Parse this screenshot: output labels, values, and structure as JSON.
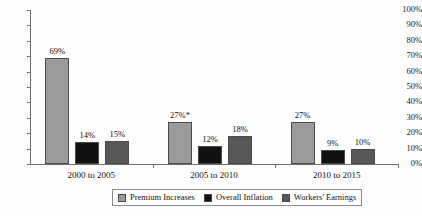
{
  "chart_data": {
    "type": "bar",
    "title": "",
    "subtitle": "",
    "xlabel": "",
    "ylabel": "",
    "ylim": [
      0,
      100
    ],
    "grid": false,
    "legend_position": "bottom",
    "categories": [
      "2000 to 2005",
      "2005 to 2010",
      "2010 to 2015"
    ],
    "y_ticks": [
      "0%",
      "10%",
      "20%",
      "30%",
      "40%",
      "50%",
      "60%",
      "70%",
      "80%",
      "90%",
      "100%"
    ],
    "y_tick_values": [
      0,
      10,
      20,
      30,
      40,
      50,
      60,
      70,
      80,
      90,
      100
    ],
    "series": [
      {
        "name": "Premium Increases",
        "color": "#9b9b9b",
        "values": [
          69,
          27,
          27
        ],
        "labels": [
          "69%",
          "27%*",
          "27%"
        ]
      },
      {
        "name": "Overall Inflation",
        "color": "#111111",
        "values": [
          14,
          12,
          9
        ],
        "labels": [
          "14%",
          "12%",
          "9%"
        ]
      },
      {
        "name": "Workers' Earnings",
        "color": "#58585a",
        "values": [
          15,
          18,
          10
        ],
        "labels": [
          "15%",
          "18%",
          "10%"
        ]
      }
    ]
  },
  "colors": {
    "axis": "#6f6f6f",
    "text": "#111111",
    "background": "#fdfdfd",
    "legend_border": "#8a8a8a"
  }
}
